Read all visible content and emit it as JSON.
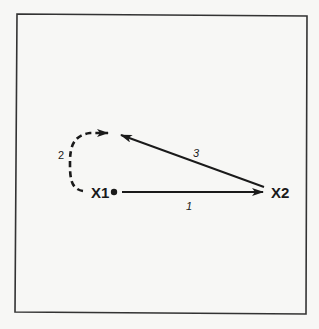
{
  "diagram": {
    "type": "movement-diagram",
    "colors": {
      "background": "#f7f7f5",
      "frame": "#333333",
      "ink": "#1a1a1a"
    },
    "nodes": [
      {
        "id": "X1",
        "label": "X1",
        "marker": "filled-dot"
      },
      {
        "id": "X2",
        "label": "X2",
        "marker": "none"
      }
    ],
    "edges": [
      {
        "id": "1",
        "label": "1",
        "from": "X1",
        "to": "X2",
        "style": "solid",
        "shape": "straight"
      },
      {
        "id": "2",
        "label": "2",
        "from": "X1",
        "to": "upper-left point",
        "style": "dashed",
        "shape": "curved"
      },
      {
        "id": "3",
        "label": "3",
        "from": "X2",
        "to": "upper-left point",
        "style": "solid",
        "shape": "straight"
      }
    ]
  }
}
